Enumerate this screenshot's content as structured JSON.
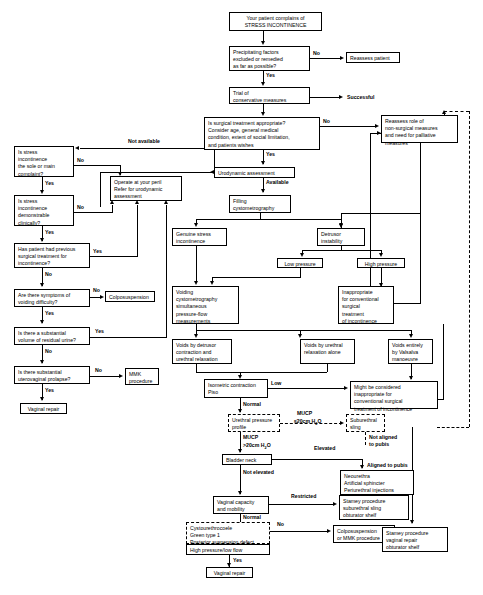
{
  "diagram": {
    "nodes": {
      "start": "Your patient complains of\nSTRESS INCONTINENCE",
      "precipitating": "Precipitating factors\nexcluded or remedied\nas far as possible?",
      "reassess_patient": "Reassess patient",
      "trial_conservative": "Trial of\nconservative measures",
      "successful": "Successful",
      "surgical_appropriate": "Is surgical treatment appropriate?\nConsider age, general medical\ncondition, extent of social limitation,\nand patients wishes",
      "reassess_role": "Reassess role of\nnon-surgical measures\nand need for palliative\nmeasures",
      "urodynamic_assessment": "Urodynamic assessment",
      "filling_cystometrography": "Filling\ncystometrography",
      "sole_complaint": "Is stress\nincontinence\nthe sole or main\ncomplaint?",
      "demonstrable": "Is stress\nincontinence\ndemonstrable\nclinically?",
      "previous_surgery": "Has patient had previous\nsurgical treatment for\nincontinence?",
      "operate_peril": "Operate at your peril\nRefer for urodynamic\nassessment",
      "voiding_difficulty": "Are there symptoms of\nvoiding difficulty?",
      "colposuspension": "Colposuspension",
      "residual_urine": "Is there a substantial\nvolume of residual urine?",
      "uterovaginal_prolapse": "Is there substantial\nuterovaginal prolapse?",
      "mmk_procedure": "MMK\nprocedure",
      "vaginal_repair_left": "Vaginal repair",
      "genuine_stress": "Genuine stress\nincontinence",
      "detrusor_instability": "Detrusor\ninstability",
      "low_pressure": "Low pressure",
      "high_pressure": "High pressure",
      "voiding_cystometrography": "Voiding\ncystometrography\nsimultaneous\npressure-flow\nmeasurements",
      "inappropriate_conventional": "Inappropriate\nfor conventional\nsurgical\ntreatment\nof incontinence",
      "voids_detrusor": "Voids by detrusor\ncontraction and\nurethral relaxation",
      "voids_urethral": "Voids by urethral\nrelaxation alone",
      "voids_valsalva": "Voids entirely\nby Valsalva\nmanoeuvre",
      "isometric": "Isometric contraction\nPiso",
      "might_be_considered": "Might be considered\ninappropriate for\nconventional surgical\ntreatment of incontinence",
      "urethral_pressure_profile": "Urethral pressure\nprofile",
      "suburethral_sling": "Suburethral\nsling",
      "bladder_neck": "Bladder neck",
      "neourethra": "Neourethra\nArtificial sphincter\nPeriurethral injections",
      "vaginal_capacity": "Vaginal capacity\nand mobility",
      "stamey_suburethral": "Stamey procedure\nsuburethral sling\nobturator shelf",
      "cystourethrocoele": "Cystourethrocoele\nGreen type 1\nPosterior suspension defect",
      "high_pressure_low_flow": "High pressure/low flow",
      "colpo_or_mmk": "Colposuspension\nor MMK procedure",
      "vaginal_repair_bottom": "Vaginal repair",
      "stamey_vaginal": "Stamey procedure\nvaginal repair\nobturator shelf"
    },
    "edge_labels": {
      "no_1": "No",
      "yes_1": "Yes",
      "no_2": "No",
      "yes_2": "Yes",
      "available": "Available",
      "not_available": "Not available",
      "no_sole": "No",
      "yes_sole": "Yes",
      "no_demo": "No",
      "yes_demo": "Yes",
      "yes_prev": "Yes",
      "no_prev": "No",
      "no_void": "No",
      "yes_void": "Yes",
      "yes_residual": "Yes",
      "no_residual": "No",
      "no_prolapse": "No",
      "yes_prolapse": "Yes",
      "low": "Low",
      "normal_iso": "Normal",
      "mucp_low": "MUCP",
      "mucp_low_val": "≤20cm H",
      "mucp_low_sub": "2",
      "mucp_low_tail": "O",
      "mucp_high": "MUCP",
      "mucp_high_val": ">20cm H",
      "mucp_high_sub": "2",
      "mucp_high_tail": "O",
      "not_aligned": "Not aligned\nto pubis",
      "elevated": "Elevated",
      "aligned_pubis": "Aligned to pubis",
      "not_elevated": "Not elevated",
      "restricted": "Restricted",
      "normal_vag": "Normal",
      "no_cysto": "No",
      "yes_cysto": "Yes"
    }
  }
}
